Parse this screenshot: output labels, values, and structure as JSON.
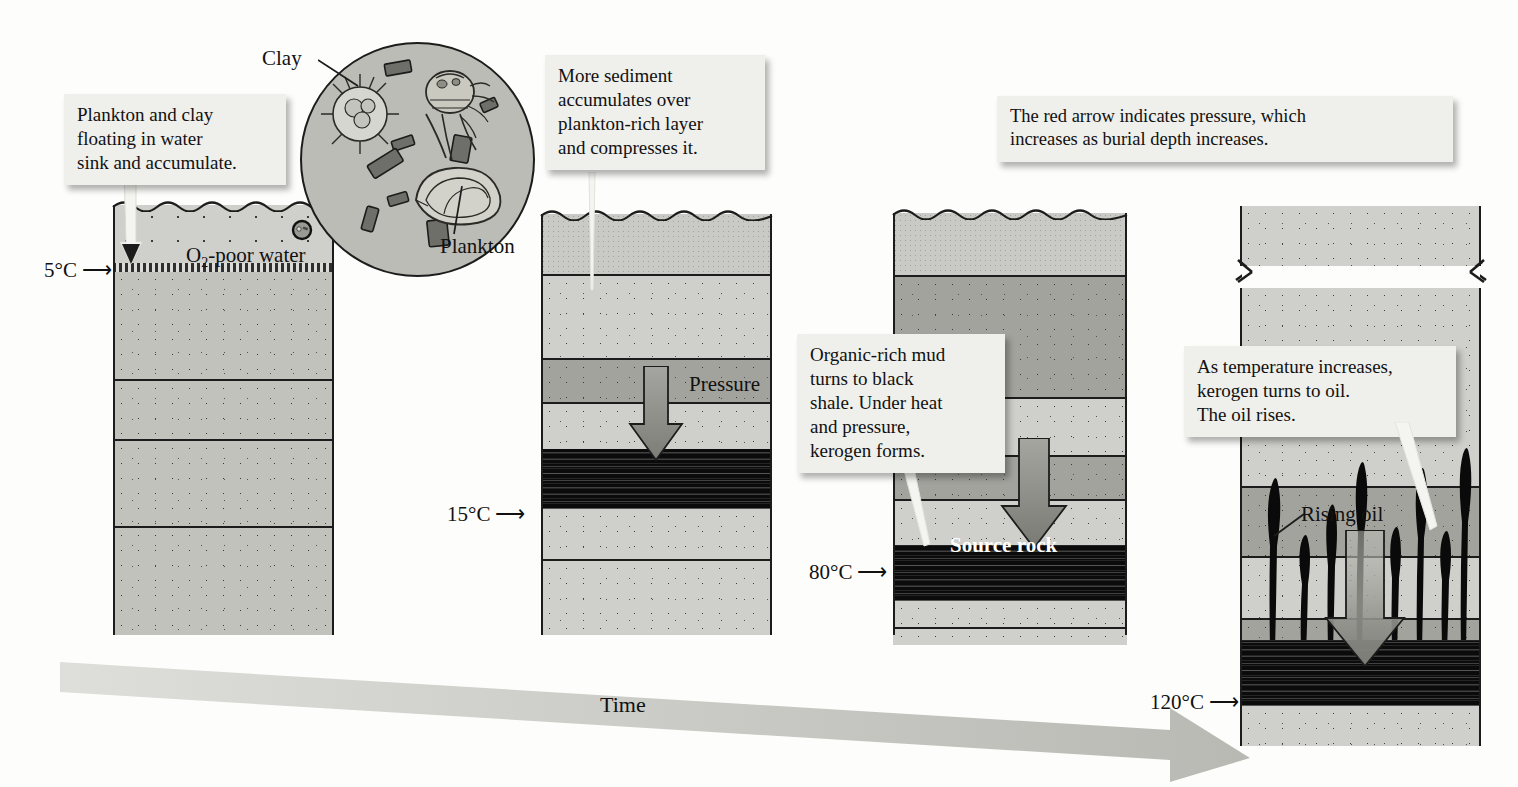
{
  "figure": {
    "time_axis_label": "Time"
  },
  "callouts": {
    "stage1": "Plankton and clay\nfloating in water\nsink and accumulate.",
    "stage2": "More sediment\naccumulates over\nplankton-rich layer\nand compresses it.",
    "stage3": "Organic-rich mud\nturns to black\nshale. Under heat\nand pressure,\nkerogen forms.",
    "stage4": "As temperature increases,\nkerogen turns to oil.\nThe oil rises.",
    "pressure_note": "The red arrow indicates pressure, which\nincreases as burial depth increases."
  },
  "magnifier": {
    "clay_label": "Clay",
    "plankton_label": "Plankton"
  },
  "panels": [
    {
      "id": "panel-1",
      "temperature": "5°C",
      "water_label": "O",
      "water_label_sub": "2",
      "water_label_rest": "-poor water"
    },
    {
      "id": "panel-2",
      "temperature": "15°C",
      "pressure_label": "Pressure"
    },
    {
      "id": "panel-3",
      "temperature": "80°C",
      "source_rock_label": "Source rock"
    },
    {
      "id": "panel-4",
      "temperature": "120°C",
      "rising_oil_label": "Rising oil"
    }
  ],
  "colors": {
    "sediment_light": "#cfcfcb",
    "sediment_mid": "#c2c2bd",
    "sediment_dark": "#a3a39d",
    "shale_black": "#0b0b0b",
    "callout_bg": "#efefeb",
    "outline": "#1c1c1c",
    "pressure_arrow": "#8f8f89",
    "time_arrow": "#c8c8c4"
  }
}
